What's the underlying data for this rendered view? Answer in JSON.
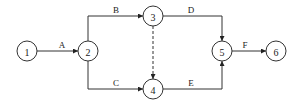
{
  "diagram": {
    "type": "activity-on-arrow network",
    "nodes": [
      {
        "id": "1",
        "label": "1",
        "x": 27,
        "y": 51
      },
      {
        "id": "2",
        "label": "2",
        "x": 88,
        "y": 51
      },
      {
        "id": "3",
        "label": "3",
        "x": 153,
        "y": 16
      },
      {
        "id": "4",
        "label": "4",
        "x": 153,
        "y": 89
      },
      {
        "id": "5",
        "label": "5",
        "x": 222,
        "y": 51
      },
      {
        "id": "6",
        "label": "6",
        "x": 276,
        "y": 51
      }
    ],
    "edges": [
      {
        "from": "1",
        "to": "2",
        "label": "A",
        "style": "solid"
      },
      {
        "from": "2",
        "to": "3",
        "label": "B",
        "style": "solid"
      },
      {
        "from": "2",
        "to": "4",
        "label": "C",
        "style": "solid"
      },
      {
        "from": "3",
        "to": "5",
        "label": "D",
        "style": "solid"
      },
      {
        "from": "4",
        "to": "5",
        "label": "E",
        "style": "solid"
      },
      {
        "from": "3",
        "to": "4",
        "label": "",
        "style": "dashed"
      },
      {
        "from": "5",
        "to": "6",
        "label": "F",
        "style": "solid"
      }
    ]
  }
}
